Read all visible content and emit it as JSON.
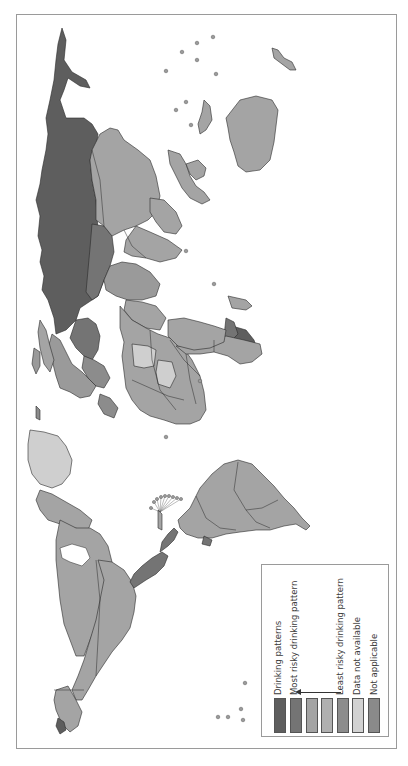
{
  "map": {
    "orientation": "rotated 90° counter-clockwise (north points left)",
    "colors": {
      "level_1_most_risky": "#5e5e5e",
      "level_2": "#747474",
      "level_3": "#9f9f9f",
      "level_4": "#ababab",
      "level_5_least_risky": "#8a8a8a",
      "data_not_available": "#cfcfcf",
      "not_applicable": "#888888",
      "border": "#2a2a2a",
      "frame": "#9a9a9a"
    }
  },
  "legend": {
    "title": "Drinking patterns",
    "most_label": "Most risky drinking pattern",
    "least_label": "Least risky drinking pattern",
    "na_label": "Data not available",
    "notapp_label": "Not applicable",
    "swatches": [
      {
        "label": "Level 1 (most risky)",
        "color": "#5e5e5e"
      },
      {
        "label": "Level 2",
        "color": "#747474"
      },
      {
        "label": "Level 3",
        "color": "#a4a4a4"
      },
      {
        "label": "Level 4",
        "color": "#b0b0b0"
      },
      {
        "label": "Level 5 (least risky)",
        "color": "#8c8c8c"
      },
      {
        "label": "Data not available",
        "color": "#d2d2d2"
      },
      {
        "label": "Not applicable",
        "color": "#8a8a8a"
      }
    ]
  }
}
